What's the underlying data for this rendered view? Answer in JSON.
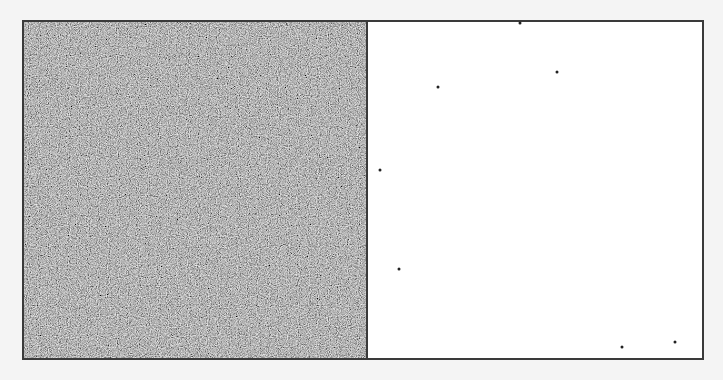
{
  "figure": {
    "colors": {
      "background": "#f4f4f4",
      "border": "#3a3a3a",
      "noise_base": "#7a7a7a",
      "right_panel": "#ffffff",
      "dot": "#222222"
    },
    "left_panel": {
      "type": "dense-noise"
    },
    "right_panel": {
      "type": "sparse-dots",
      "dots": [
        {
          "x": 152,
          "y": 1
        },
        {
          "x": 189,
          "y": 50
        },
        {
          "x": 70,
          "y": 65
        },
        {
          "x": 12,
          "y": 148
        },
        {
          "x": 31,
          "y": 247
        },
        {
          "x": 254,
          "y": 325
        },
        {
          "x": 307,
          "y": 320
        }
      ]
    }
  }
}
